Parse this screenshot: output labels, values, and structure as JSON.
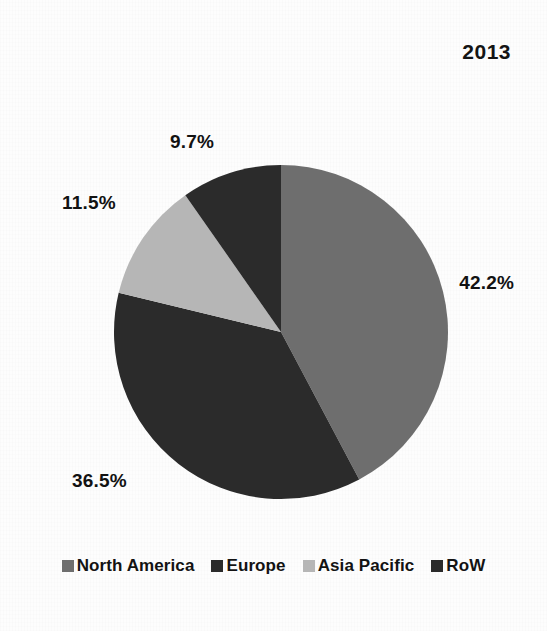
{
  "title": "2013",
  "colors": {
    "north_america": "#6e6e6e",
    "europe": "#2b2b2b",
    "asia_pacific": "#b6b6b6",
    "row": "#2b2b2b",
    "background": "#fdfdfd",
    "text": "#121212"
  },
  "labels": {
    "north_america": "42.2%",
    "europe": "36.5%",
    "asia_pacific": "11.5%",
    "row": "9.7%"
  },
  "legend": {
    "items": [
      {
        "label": "North America",
        "color": "#6e6e6e"
      },
      {
        "label": "Europe",
        "color": "#2b2b2b"
      },
      {
        "label": "Asia Pacific",
        "color": "#b6b6b6"
      },
      {
        "label": "RoW",
        "color": "#2b2b2b"
      }
    ]
  },
  "chart_data": {
    "type": "pie",
    "title": "2013",
    "xlabel": "",
    "ylabel": "",
    "categories": [
      "North America",
      "Europe",
      "Asia Pacific",
      "RoW"
    ],
    "values": [
      42.2,
      36.5,
      11.5,
      9.7
    ],
    "data_labels": [
      "42.2%",
      "36.5%",
      "11.5%",
      "9.7%"
    ],
    "units": "percent",
    "total": 99.9,
    "start_angle_deg": 0,
    "direction": "clockwise",
    "colors": [
      "#6e6e6e",
      "#2b2b2b",
      "#b6b6b6",
      "#2b2b2b"
    ],
    "legend": [
      "North America",
      "Europe",
      "Asia Pacific",
      "RoW"
    ],
    "legend_position": "bottom",
    "grid": false
  }
}
